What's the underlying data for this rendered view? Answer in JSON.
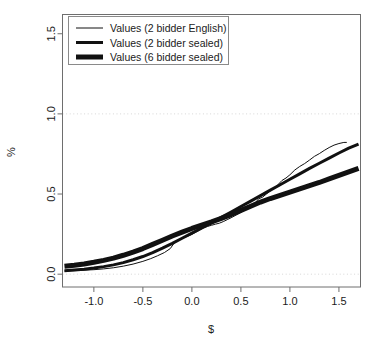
{
  "chart_data": {
    "type": "line",
    "title": "",
    "xlabel": "$",
    "ylabel": "%",
    "xlim": [
      -1.32,
      1.72
    ],
    "ylim": [
      -0.08,
      1.62
    ],
    "xticks": [
      -1.0,
      -0.5,
      0.0,
      0.5,
      1.0,
      1.5
    ],
    "xticklabels": [
      "-1.0",
      "-0.5",
      "0.0",
      "0.5",
      "1.0",
      "1.5"
    ],
    "yticks": [
      0.0,
      0.5,
      1.0,
      1.5
    ],
    "yticklabels": [
      "0.0",
      "0.5",
      "1.0",
      "1.5"
    ],
    "grid": true,
    "gridlines_y": [
      0.0,
      1.0
    ],
    "legend_position": "top-left",
    "legend_entries": [
      {
        "label": "Values (2 bidder English)",
        "linewidth": 1
      },
      {
        "label": "Values (2 bidder sealed)",
        "linewidth": 3
      },
      {
        "label": "Values (6 bidder sealed)",
        "linewidth": 5
      }
    ],
    "series": [
      {
        "name": "Values (2 bidder English)",
        "linewidth": 1,
        "color": "#111111",
        "x": [
          -1.3,
          -1.2,
          -1.1,
          -1.0,
          -0.9,
          -0.8,
          -0.7,
          -0.6,
          -0.5,
          -0.42,
          -0.35,
          -0.28,
          -0.22,
          -0.18,
          -0.14,
          -0.1,
          -0.05,
          0.0,
          0.04,
          0.08,
          0.12,
          0.16,
          0.2,
          0.24,
          0.28,
          0.32,
          0.36,
          0.4,
          0.44,
          0.48,
          0.52,
          0.56,
          0.6,
          0.64,
          0.68,
          0.72,
          0.76,
          0.8,
          0.84,
          0.88,
          0.92,
          0.96,
          1.0,
          1.05,
          1.1,
          1.15,
          1.2,
          1.25,
          1.3,
          1.35,
          1.4,
          1.45,
          1.5,
          1.55,
          1.58
        ],
        "y": [
          0.02,
          0.022,
          0.025,
          0.028,
          0.033,
          0.04,
          0.05,
          0.063,
          0.08,
          0.097,
          0.115,
          0.135,
          0.16,
          0.195,
          0.215,
          0.225,
          0.235,
          0.248,
          0.262,
          0.275,
          0.288,
          0.298,
          0.305,
          0.312,
          0.318,
          0.328,
          0.34,
          0.352,
          0.365,
          0.378,
          0.392,
          0.405,
          0.42,
          0.44,
          0.47,
          0.48,
          0.5,
          0.52,
          0.535,
          0.56,
          0.585,
          0.6,
          0.62,
          0.65,
          0.672,
          0.69,
          0.712,
          0.735,
          0.752,
          0.772,
          0.79,
          0.805,
          0.815,
          0.822,
          0.822
        ]
      },
      {
        "name": "Values (2 bidder sealed)",
        "linewidth": 3,
        "color": "#111111",
        "x": [
          -1.3,
          -1.2,
          -1.1,
          -1.0,
          -0.9,
          -0.8,
          -0.7,
          -0.6,
          -0.5,
          -0.4,
          -0.3,
          -0.2,
          -0.1,
          0.0,
          0.1,
          0.2,
          0.3,
          0.4,
          0.5,
          0.6,
          0.7,
          0.8,
          0.9,
          1.0,
          1.1,
          1.2,
          1.3,
          1.4,
          1.5,
          1.6,
          1.7
        ],
        "y": [
          0.022,
          0.026,
          0.031,
          0.038,
          0.047,
          0.058,
          0.072,
          0.09,
          0.11,
          0.134,
          0.162,
          0.192,
          0.224,
          0.256,
          0.288,
          0.32,
          0.354,
          0.388,
          0.422,
          0.456,
          0.49,
          0.524,
          0.558,
          0.592,
          0.626,
          0.66,
          0.692,
          0.724,
          0.756,
          0.786,
          0.812
        ]
      },
      {
        "name": "Values (6 bidder sealed)",
        "linewidth": 5,
        "color": "#111111",
        "x": [
          -1.3,
          -1.2,
          -1.1,
          -1.0,
          -0.9,
          -0.8,
          -0.7,
          -0.6,
          -0.5,
          -0.4,
          -0.3,
          -0.2,
          -0.1,
          0.0,
          0.1,
          0.2,
          0.3,
          0.4,
          0.5,
          0.6,
          0.7,
          0.8,
          0.9,
          1.0,
          1.1,
          1.2,
          1.3,
          1.4,
          1.5,
          1.6,
          1.7
        ],
        "y": [
          0.05,
          0.056,
          0.064,
          0.074,
          0.086,
          0.1,
          0.118,
          0.138,
          0.16,
          0.186,
          0.212,
          0.238,
          0.262,
          0.285,
          0.306,
          0.326,
          0.348,
          0.372,
          0.398,
          0.424,
          0.45,
          0.472,
          0.492,
          0.512,
          0.532,
          0.552,
          0.572,
          0.594,
          0.616,
          0.638,
          0.66
        ]
      }
    ]
  }
}
